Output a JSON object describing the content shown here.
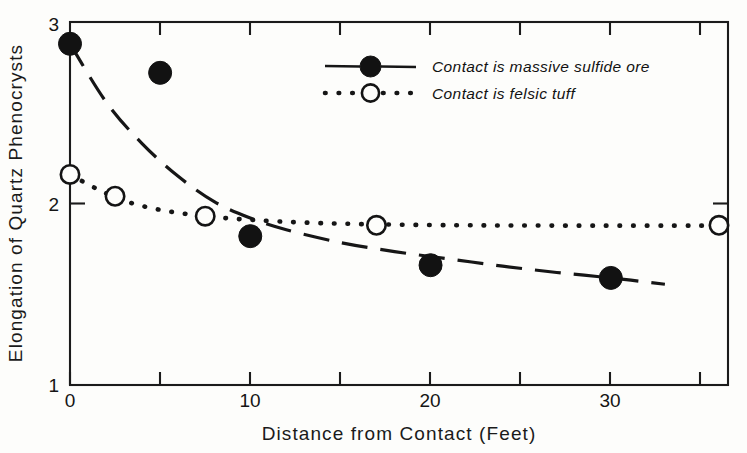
{
  "chart_data": {
    "type": "scatter",
    "title": "",
    "xlabel": "Distance from Contact (Feet)",
    "ylabel": "Elongation of Quartz Phenocrysts",
    "xlim": [
      0,
      36.5
    ],
    "ylim": [
      1,
      3
    ],
    "xticks": [
      0,
      10,
      20,
      30
    ],
    "xtick_labels": [
      "0",
      "10",
      "20",
      "30"
    ],
    "xminor_ticks": [
      5,
      15,
      25,
      35
    ],
    "yticks": [
      1,
      2,
      3
    ],
    "ytick_labels": [
      "1",
      "2",
      "3"
    ],
    "grid": false,
    "legend_position": "upper right",
    "series": [
      {
        "name": "Contact is massive sulfide ore",
        "marker": "filled-circle",
        "line_style": "dashed",
        "points": [
          {
            "x": 0,
            "y": 2.88
          },
          {
            "x": 5,
            "y": 2.72
          },
          {
            "x": 10,
            "y": 1.82
          },
          {
            "x": 20,
            "y": 1.66
          },
          {
            "x": 30,
            "y": 1.59
          }
        ],
        "curve": [
          {
            "x": 0,
            "y": 2.88
          },
          {
            "x": 2,
            "y": 2.56
          },
          {
            "x": 4,
            "y": 2.33
          },
          {
            "x": 6,
            "y": 2.15
          },
          {
            "x": 8,
            "y": 2.01
          },
          {
            "x": 10,
            "y": 1.92
          },
          {
            "x": 12,
            "y": 1.855
          },
          {
            "x": 15,
            "y": 1.785
          },
          {
            "x": 18,
            "y": 1.735
          },
          {
            "x": 21,
            "y": 1.695
          },
          {
            "x": 24,
            "y": 1.655
          },
          {
            "x": 27,
            "y": 1.62
          },
          {
            "x": 30,
            "y": 1.59
          },
          {
            "x": 33,
            "y": 1.555
          }
        ]
      },
      {
        "name": "Contact is felsic tuff",
        "marker": "open-circle",
        "line_style": "dotted",
        "points": [
          {
            "x": 0,
            "y": 2.16
          },
          {
            "x": 2.5,
            "y": 2.04
          },
          {
            "x": 7.5,
            "y": 1.93
          },
          {
            "x": 17,
            "y": 1.88
          },
          {
            "x": 36,
            "y": 1.88
          }
        ],
        "curve": [
          {
            "x": 0,
            "y": 2.16
          },
          {
            "x": 1.5,
            "y": 2.08
          },
          {
            "x": 3,
            "y": 2.015
          },
          {
            "x": 5,
            "y": 1.965
          },
          {
            "x": 7.5,
            "y": 1.93
          },
          {
            "x": 10,
            "y": 1.91
          },
          {
            "x": 13,
            "y": 1.895
          },
          {
            "x": 17,
            "y": 1.885
          },
          {
            "x": 22,
            "y": 1.88
          },
          {
            "x": 28,
            "y": 1.878
          },
          {
            "x": 36,
            "y": 1.878
          }
        ]
      }
    ],
    "legend": [
      {
        "label": "Contact is massive sulfide ore",
        "marker": "filled-circle",
        "line_style": "dashed"
      },
      {
        "label": "Contact is felsic tuff",
        "marker": "open-circle",
        "line_style": "dotted"
      }
    ],
    "colors": {
      "ink": "#161616",
      "paper": "#fdfdfb"
    }
  }
}
